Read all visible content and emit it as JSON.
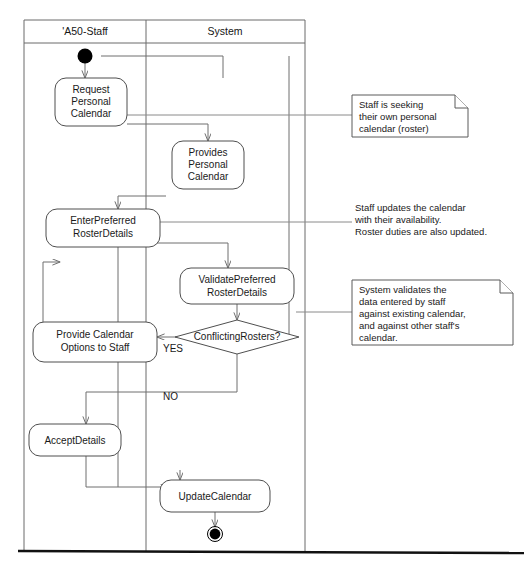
{
  "diagram": {
    "type": "uml-activity-diagram"
  },
  "swimlanes": [
    {
      "id": "staff",
      "label": "'A50-Staff"
    },
    {
      "id": "system",
      "label": "System"
    }
  ],
  "nodes": {
    "start": {
      "kind": "initial-node",
      "lane": "staff"
    },
    "request_personal_calendar": {
      "kind": "activity",
      "lane": "staff",
      "lines": [
        "Request",
        "Personal",
        "Calendar"
      ]
    },
    "provides_personal_calendar": {
      "kind": "activity",
      "lane": "system",
      "lines": [
        "Provides",
        "Personal",
        "Calendar"
      ]
    },
    "enter_preferred_roster_details": {
      "kind": "activity",
      "lane": "staff",
      "lines": [
        "EnterPreferred",
        "RosterDetails"
      ]
    },
    "validate_preferred_roster_details": {
      "kind": "activity",
      "lane": "system",
      "lines": [
        "ValidatePreferred",
        "RosterDetails"
      ]
    },
    "conflicting_rosters": {
      "kind": "decision",
      "lane": "system",
      "lines": [
        "ConflictingRosters?"
      ]
    },
    "provide_calendar_options": {
      "kind": "activity",
      "lane": "staff",
      "lines": [
        "Provide Calendar",
        "Options to Staff"
      ]
    },
    "accept_details": {
      "kind": "activity",
      "lane": "staff",
      "lines": [
        "AcceptDetails"
      ]
    },
    "update_calendar": {
      "kind": "activity",
      "lane": "system",
      "lines": [
        "UpdateCalendar"
      ]
    },
    "end": {
      "kind": "final-node",
      "lane": "system"
    }
  },
  "edge_labels": {
    "yes": "YES",
    "no": "NO"
  },
  "notes": [
    {
      "id": "note-request",
      "boxed": true,
      "lines": [
        "Staff is seeking",
        "their own personal",
        "calendar (roster)"
      ]
    },
    {
      "id": "note-enter",
      "boxed": false,
      "lines": [
        "Staff updates the calendar",
        "with their availability.",
        "Roster duties are also updated."
      ]
    },
    {
      "id": "note-validate",
      "boxed": true,
      "lines": [
        "System validates the",
        "data entered by staff",
        "against existing calendar,",
        "and against other staff's",
        "calendar."
      ]
    }
  ],
  "colors": {
    "background": "#ffffff",
    "stroke": "#5a5a5a",
    "text": "#1a1a1a",
    "node_fill": "#ffffff",
    "baseline": "#111111"
  }
}
